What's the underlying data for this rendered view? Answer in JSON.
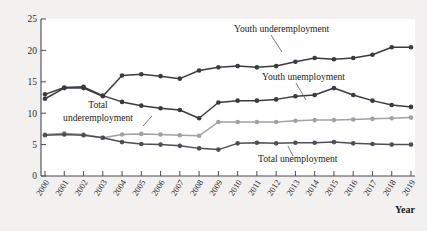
{
  "chart_data": {
    "type": "line",
    "title": "",
    "subtitle": "",
    "xlabel": "Year",
    "ylabel": "",
    "grid": false,
    "legend_position": "inline-annotations",
    "xlim": [
      2000,
      2019
    ],
    "ylim": [
      0,
      25
    ],
    "ytick_values": [
      0,
      5,
      10,
      15,
      20,
      25
    ],
    "ytick_labels": [
      "0",
      "5",
      "10",
      "15",
      "20",
      "25"
    ],
    "x": [
      2000,
      2001,
      2002,
      2003,
      2004,
      2005,
      2006,
      2007,
      2008,
      2009,
      2010,
      2011,
      2012,
      2013,
      2014,
      2015,
      2016,
      2017,
      2018,
      2019
    ],
    "xtick_labels": [
      "2000",
      "2001",
      "2002",
      "2003",
      "2004",
      "2005",
      "2006",
      "2007",
      "2008",
      "2009",
      "2010",
      "2011",
      "2012",
      "2013",
      "2014",
      "2015",
      "2016",
      "2017",
      "2018",
      "2019"
    ],
    "series": [
      {
        "name": "Youth underemployment",
        "color": "#3a3a42",
        "marker": "circle",
        "values": [
          12.3,
          14.0,
          14.0,
          12.7,
          16.0,
          16.2,
          15.9,
          15.5,
          16.8,
          17.3,
          17.5,
          17.3,
          17.5,
          18.2,
          18.8,
          18.6,
          18.8,
          19.3,
          20.5,
          20.5
        ]
      },
      {
        "name": "Youth unemployment",
        "color": "#3a3a42",
        "marker": "circle",
        "values": [
          13.0,
          14.1,
          14.2,
          12.8,
          11.8,
          11.2,
          10.8,
          10.5,
          9.2,
          11.7,
          12.0,
          12.0,
          12.2,
          12.7,
          12.9,
          14.0,
          12.9,
          12.0,
          11.3,
          11.0
        ]
      },
      {
        "name": "Total underemployment",
        "color": "#a0a0a6",
        "marker": "circle",
        "values": [
          6.6,
          6.8,
          6.6,
          6.1,
          6.6,
          6.7,
          6.6,
          6.5,
          6.4,
          8.6,
          8.6,
          8.6,
          8.6,
          8.8,
          8.9,
          8.9,
          9.0,
          9.1,
          9.2,
          9.3
        ]
      },
      {
        "name": "Total unemployment",
        "color": "#4d4d55",
        "marker": "circle",
        "values": [
          6.5,
          6.6,
          6.5,
          6.1,
          5.4,
          5.1,
          5.0,
          4.8,
          4.4,
          4.2,
          5.2,
          5.3,
          5.2,
          5.3,
          5.3,
          5.4,
          5.2,
          5.1,
          5.0,
          5.0
        ]
      }
    ],
    "annotations": [
      {
        "text": "Youth underemployment",
        "series": "Youth underemployment"
      },
      {
        "text": "Youth unemployment",
        "series": "Youth unemployment"
      },
      {
        "text": "Total underemployment",
        "series": "Total underemployment"
      },
      {
        "text": "Total unemployment",
        "series": "Total unemployment"
      }
    ]
  },
  "colors": {
    "background": "#f2f1ef",
    "plot_area": "#ffffff",
    "axis": "#4a4a52",
    "dark_series": "#3a3a42",
    "light_series": "#a0a0a6"
  }
}
